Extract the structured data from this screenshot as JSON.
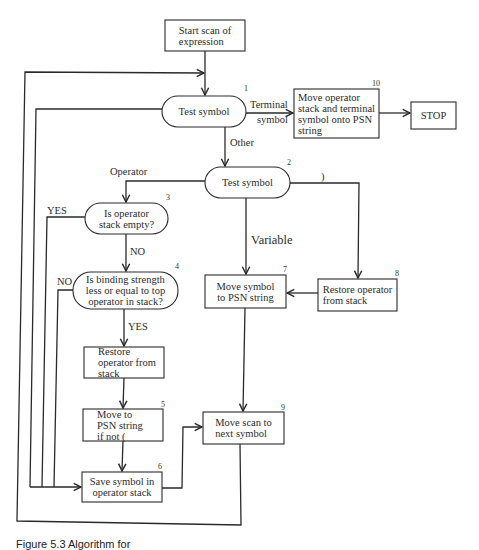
{
  "diagram": {
    "type": "flowchart",
    "nodes": [
      {
        "id": "start",
        "shape": "rectangle",
        "lines": [
          "Start scan of",
          "expression"
        ]
      },
      {
        "id": "1",
        "number": "1",
        "shape": "terminator",
        "lines": [
          "Test symbol"
        ]
      },
      {
        "id": "10",
        "number": "10",
        "shape": "rectangle",
        "lines": [
          "Move operator",
          "stack and terminal",
          "symbol onto PSN",
          "string"
        ]
      },
      {
        "id": "stop",
        "shape": "rectangle",
        "lines": [
          "STOP"
        ]
      },
      {
        "id": "2",
        "number": "2",
        "shape": "terminator",
        "lines": [
          "Test symbol"
        ]
      },
      {
        "id": "3",
        "number": "3",
        "shape": "terminator",
        "lines": [
          "Is operator",
          "stack empty?"
        ]
      },
      {
        "id": "4",
        "number": "4",
        "shape": "terminator",
        "lines": [
          "Is binding  strength",
          "less or  equal to top",
          "operator in stack?"
        ]
      },
      {
        "id": "restore1",
        "shape": "rectangle",
        "lines": [
          "Restore",
          "operator from",
          "stack"
        ]
      },
      {
        "id": "5",
        "number": "5",
        "shape": "rectangle",
        "lines": [
          "Move to",
          "PSN string",
          "if not ("
        ]
      },
      {
        "id": "6",
        "number": "6",
        "shape": "rectangle",
        "lines": [
          "Save symbol in",
          "operator stack"
        ]
      },
      {
        "id": "7",
        "number": "7",
        "shape": "rectangle",
        "lines": [
          "Move symbol",
          "to PSN string"
        ]
      },
      {
        "id": "8",
        "number": "8",
        "shape": "rectangle",
        "lines": [
          "Restore operator",
          "from stack"
        ]
      },
      {
        "id": "9",
        "number": "9",
        "shape": "rectangle",
        "lines": [
          "Move scan to",
          "next symbol"
        ]
      }
    ],
    "edge_labels": {
      "terminal_1": "Terminal",
      "terminal_2": "symbol",
      "other": "Other",
      "operator": "Operator",
      "close_paren": ")",
      "variable": "Variable",
      "yes_3": "YES",
      "no_3": "NO",
      "no_4": "NO",
      "yes_4": "YES"
    },
    "edges": [
      {
        "from": "start",
        "to": "1"
      },
      {
        "from": "1",
        "to": "10",
        "label": "Terminal symbol"
      },
      {
        "from": "10",
        "to": "stop"
      },
      {
        "from": "1",
        "to": "2",
        "label": "Other"
      },
      {
        "from": "1",
        "to": "6"
      },
      {
        "from": "2",
        "to": "3",
        "label": "Operator"
      },
      {
        "from": "2",
        "to": "7",
        "label": "Variable"
      },
      {
        "from": "2",
        "to": "8",
        "label": ")"
      },
      {
        "from": "3",
        "to": "6",
        "label": "YES"
      },
      {
        "from": "3",
        "to": "4",
        "label": "NO"
      },
      {
        "from": "4",
        "to": "6",
        "label": "NO"
      },
      {
        "from": "4",
        "to": "restore1",
        "label": "YES"
      },
      {
        "from": "restore1",
        "to": "5"
      },
      {
        "from": "5",
        "to": "6"
      },
      {
        "from": "6",
        "to": "9"
      },
      {
        "from": "8",
        "to": "7"
      },
      {
        "from": "7",
        "to": "9"
      },
      {
        "from": "9",
        "to": "1"
      }
    ],
    "caption": "Figure 5.3    Algorithm for"
  }
}
